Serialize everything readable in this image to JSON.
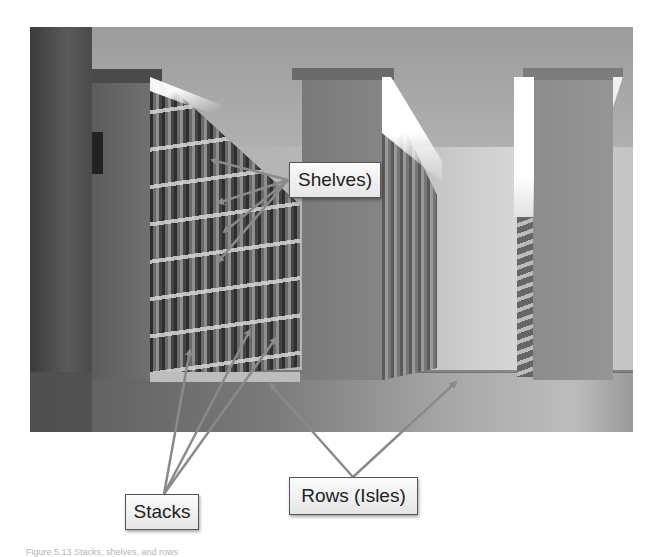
{
  "figure": {
    "labels": {
      "shelves": "Shelves)",
      "stacks": "Stacks",
      "rows": "Rows (Isles)"
    },
    "caption": "Figure 5.13 Stacks, shelves, and rows"
  },
  "colors": {
    "arrow": "#8a8a8a",
    "label_border": "#555555",
    "label_text": "#222222",
    "background": "#ffffff"
  }
}
